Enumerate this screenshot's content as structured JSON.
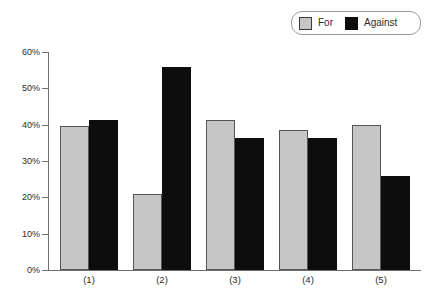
{
  "legend": {
    "entries": [
      {
        "label": "For",
        "color": "#c6c6c6",
        "swatch": "for-swatch"
      },
      {
        "label": "Against",
        "color": "#0d0d0d",
        "swatch": "against-swatch"
      }
    ]
  },
  "axis": {
    "y_ticks": [
      "0%",
      "10%",
      "20%",
      "30%",
      "40%",
      "50%",
      "60%"
    ],
    "x_ticks": [
      "(1)",
      "(2)",
      "(3)",
      "(4)",
      "(5)"
    ]
  },
  "chart_data": {
    "type": "bar",
    "title": "",
    "subtitle": "",
    "xlabel": "",
    "ylabel": "",
    "categories": [
      "(1)",
      "(2)",
      "(3)",
      "(4)",
      "(5)"
    ],
    "series": [
      {
        "name": "For",
        "color": "#c6c6c6",
        "values": [
          39.5,
          21.0,
          41.3,
          38.5,
          40.0
        ]
      },
      {
        "name": "Against",
        "color": "#0d0d0d",
        "values": [
          41.3,
          56.0,
          36.3,
          36.3,
          26.0
        ]
      }
    ],
    "ylim": [
      0,
      60
    ],
    "ytick_values": [
      0,
      10,
      20,
      30,
      40,
      50,
      60
    ],
    "ytick_labels": [
      "0%",
      "10%",
      "20%",
      "30%",
      "40%",
      "50%",
      "60%"
    ],
    "grid": false,
    "legend_position": "top-right",
    "value_format": "percent"
  }
}
